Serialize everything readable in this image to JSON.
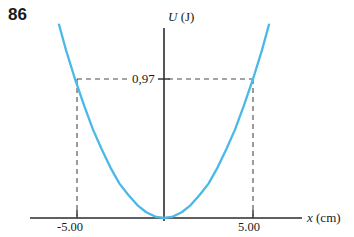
{
  "figure": {
    "problem_number": "86",
    "y_axis_label_symbol": "U",
    "y_axis_label_unit": "(J)",
    "x_axis_label_symbol": "x",
    "x_axis_label_unit": "(cm)",
    "value_label": "0,97",
    "x_tick_left": "-5.00",
    "x_tick_right": "5.00",
    "curve_color": "#4ab8e8",
    "axis_color": "#2b2b2b",
    "dash_color": "#4a4a4a"
  },
  "chart_data": {
    "type": "line",
    "title": "",
    "xlabel": "x (cm)",
    "ylabel": "U (J)",
    "xlim": [
      -7.2,
      7.2
    ],
    "ylim": [
      0,
      2.0
    ],
    "grid": false,
    "legend": null,
    "xticks": [
      -5.0,
      5.0
    ],
    "xticklabels": [
      "-5.00",
      "5.00"
    ],
    "yticks": [
      0.97
    ],
    "yticklabels": [
      "0,97"
    ],
    "annotations": [
      {
        "text": "0,97",
        "type": "horizontal-dashed-guide",
        "y": 0.97,
        "from_x": -5.0,
        "to_x": 5.0
      },
      {
        "text": "",
        "type": "vertical-dashed-guide",
        "x": -5.0,
        "from_y": 0,
        "to_y": 0.97
      },
      {
        "text": "",
        "type": "vertical-dashed-guide",
        "x": 5.0,
        "from_y": 0,
        "to_y": 0.97
      }
    ],
    "series": [
      {
        "name": "U(x) = k x^2 / 2",
        "comment": "parabola, vertex at origin; U(+/-5.00 cm) = 0,97 J",
        "x": [
          -5.9,
          -5.5,
          -5.0,
          -4.5,
          -4.0,
          -3.5,
          -3.0,
          -2.5,
          -2.0,
          -1.5,
          -1.0,
          -0.5,
          0.0,
          0.5,
          1.0,
          1.5,
          2.0,
          2.5,
          3.0,
          3.5,
          4.0,
          4.5,
          5.0,
          5.5,
          5.9
        ],
        "y": [
          1.35,
          1.17,
          0.97,
          0.79,
          0.62,
          0.48,
          0.35,
          0.24,
          0.16,
          0.09,
          0.04,
          0.01,
          0.0,
          0.01,
          0.04,
          0.09,
          0.16,
          0.24,
          0.35,
          0.48,
          0.62,
          0.79,
          0.97,
          1.17,
          1.35
        ]
      }
    ]
  }
}
